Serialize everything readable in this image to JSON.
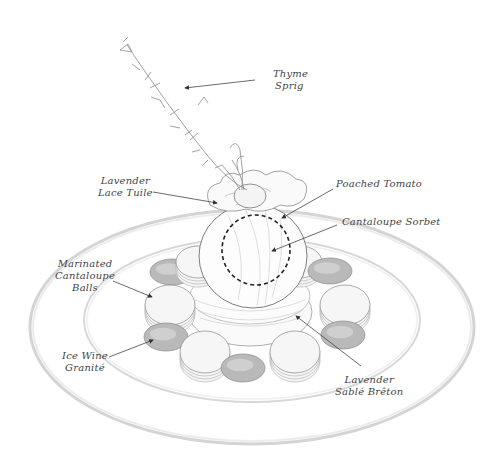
{
  "diagram": {
    "labels": {
      "thyme_sprig": [
        "Thyme",
        "Sprig"
      ],
      "lavender_lace_tuile": [
        "Lavender",
        "Lace Tuile"
      ],
      "poached_tomato": [
        "Poached Tomato"
      ],
      "cantaloupe_sorbet": [
        "Cantaloupe Sorbet"
      ],
      "marinated_cantaloupe_balls": [
        "Marinated",
        "Cantaloupe",
        "Balls"
      ],
      "ice_wine_granite": [
        "Ice Wine",
        "Granité"
      ],
      "lavender_sable_breton": [
        "Lavender",
        "Sablé Brêton"
      ]
    },
    "colors": {
      "line": "#555555",
      "plate_rim": "#cfcfcf",
      "granite": "#b9b9b9",
      "cantaloupe": "#f6f6f6"
    }
  }
}
